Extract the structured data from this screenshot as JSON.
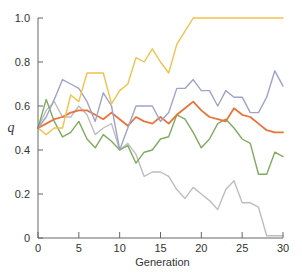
{
  "chart_data": {
    "type": "line",
    "title": "",
    "xlabel": "Generation",
    "ylabel": "q",
    "xlim": [
      0,
      30
    ],
    "ylim": [
      0,
      1.0
    ],
    "grid": false,
    "legend": "none",
    "x_ticks": [
      0,
      5,
      10,
      15,
      20,
      25,
      30
    ],
    "y_ticks": [
      0,
      0.2,
      0.4,
      0.6,
      0.8,
      1.0
    ],
    "y_tick_labels": [
      "0",
      "0.2",
      "0.4",
      "0.6",
      "0.8",
      "1.0"
    ],
    "x": [
      0,
      1,
      2,
      3,
      4,
      5,
      6,
      7,
      8,
      9,
      10,
      11,
      12,
      13,
      14,
      15,
      16,
      17,
      18,
      19,
      20,
      21,
      22,
      23,
      24,
      25,
      26,
      27,
      28,
      29,
      30
    ],
    "series": [
      {
        "name": "population-1",
        "color": "#f2c14e",
        "values": [
          0.5,
          0.47,
          0.5,
          0.5,
          0.65,
          0.62,
          0.75,
          0.75,
          0.75,
          0.61,
          0.67,
          0.7,
          0.82,
          0.8,
          0.86,
          0.8,
          0.75,
          0.88,
          0.94,
          1.0,
          1.0,
          1.0,
          1.0,
          1.0,
          1.0,
          1.0,
          1.0,
          1.0,
          1.0,
          1.0,
          1.0
        ]
      },
      {
        "name": "population-2",
        "color": "#9ea3c9",
        "values": [
          0.5,
          0.55,
          0.63,
          0.72,
          0.7,
          0.68,
          0.62,
          0.53,
          0.66,
          0.6,
          0.4,
          0.5,
          0.6,
          0.6,
          0.6,
          0.53,
          0.57,
          0.68,
          0.68,
          0.72,
          0.67,
          0.67,
          0.6,
          0.67,
          0.64,
          0.64,
          0.57,
          0.57,
          0.64,
          0.76,
          0.69
        ]
      },
      {
        "name": "population-3",
        "color": "#e8743b",
        "values": [
          0.5,
          0.52,
          0.54,
          0.55,
          0.57,
          0.58,
          0.58,
          0.56,
          0.54,
          0.57,
          0.54,
          0.51,
          0.55,
          0.53,
          0.52,
          0.55,
          0.52,
          0.56,
          0.59,
          0.62,
          0.58,
          0.55,
          0.54,
          0.53,
          0.59,
          0.56,
          0.55,
          0.52,
          0.49,
          0.48,
          0.48
        ]
      },
      {
        "name": "population-4",
        "color": "#7faa5f",
        "values": [
          0.5,
          0.63,
          0.53,
          0.46,
          0.48,
          0.53,
          0.45,
          0.41,
          0.47,
          0.44,
          0.4,
          0.42,
          0.34,
          0.39,
          0.4,
          0.45,
          0.46,
          0.56,
          0.54,
          0.48,
          0.41,
          0.45,
          0.52,
          0.54,
          0.5,
          0.45,
          0.43,
          0.29,
          0.29,
          0.39,
          0.37
        ]
      },
      {
        "name": "population-5",
        "color": "#bdbdbd",
        "values": [
          0.5,
          0.58,
          0.62,
          0.55,
          0.55,
          0.6,
          0.56,
          0.47,
          0.5,
          0.52,
          0.4,
          0.43,
          0.38,
          0.28,
          0.3,
          0.3,
          0.28,
          0.22,
          0.18,
          0.23,
          0.2,
          0.17,
          0.13,
          0.22,
          0.26,
          0.16,
          0.16,
          0.14,
          0.01,
          0.01,
          0.01
        ]
      }
    ]
  },
  "axes": {
    "color": "#666666",
    "x_title": "Generation",
    "y_title": "q"
  }
}
